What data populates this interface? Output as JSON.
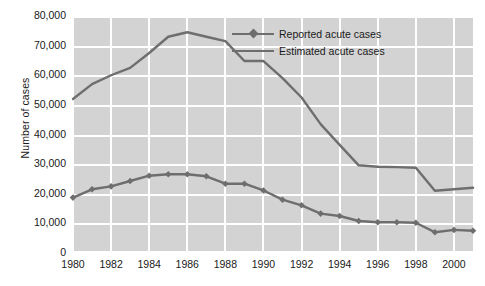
{
  "chart_data": {
    "type": "line",
    "title": "",
    "xlabel": "",
    "ylabel": "Number of cases",
    "ylim": [
      0,
      80000
    ],
    "xlim": [
      1980,
      2001
    ],
    "grid": true,
    "legend_position": "top-right",
    "y_ticks": [
      "0",
      "10,000",
      "20,000",
      "30,000",
      "40,000",
      "50,000",
      "60,000",
      "70,000",
      "80,000"
    ],
    "y_tick_values": [
      0,
      10000,
      20000,
      30000,
      40000,
      50000,
      60000,
      70000,
      80000
    ],
    "x_ticks": [
      "1980",
      "1982",
      "1984",
      "1986",
      "1988",
      "1990",
      "1992",
      "1994",
      "1996",
      "1998",
      "2000"
    ],
    "x_tick_values": [
      1980,
      1982,
      1984,
      1986,
      1988,
      1990,
      1992,
      1994,
      1996,
      1998,
      2000
    ],
    "x": [
      1980,
      1981,
      1982,
      1983,
      1984,
      1985,
      1986,
      1987,
      1988,
      1989,
      1990,
      1991,
      1992,
      1993,
      1994,
      1995,
      1996,
      1997,
      1998,
      1999,
      2000,
      2001
    ],
    "series": [
      {
        "name": "Reported acute cases",
        "marker": "diamond",
        "color": "#6e6e6e",
        "values": [
          18700,
          21500,
          22500,
          24300,
          26100,
          26600,
          26600,
          25900,
          23400,
          23400,
          21100,
          18000,
          16100,
          13300,
          12500,
          10800,
          10400,
          10400,
          10200,
          7000,
          7800,
          7500
        ]
      },
      {
        "name": "Estimated acute cases",
        "marker": "none",
        "color": "#6e6e6e",
        "values": [
          52000,
          57000,
          60000,
          62500,
          67500,
          73000,
          74500,
          73000,
          71500,
          64800,
          64800,
          59000,
          52500,
          43500,
          36500,
          29600,
          29100,
          29000,
          28800,
          21000,
          21500,
          22000
        ]
      }
    ]
  },
  "legend": {
    "items": [
      {
        "label": "Reported acute cases",
        "marker": "diamond"
      },
      {
        "label": "Estimated acute cases",
        "marker": "none"
      }
    ]
  },
  "axis": {
    "y_title": "Number of cases"
  },
  "colors": {
    "plot_background": "#d3d3d3",
    "gridline": "#ffffff",
    "series_line": "#6e6e6e",
    "text": "#1a1a1a",
    "page_background": "#ffffff"
  }
}
